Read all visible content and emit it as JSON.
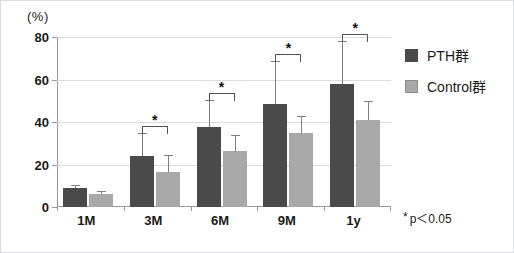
{
  "chart_data": {
    "type": "bar",
    "title": "",
    "subtitle": "",
    "xlabel": "",
    "ylabel": "(%)",
    "ylim": [
      0,
      80
    ],
    "ytick_labels": [
      "0",
      "20",
      "40",
      "60",
      "80"
    ],
    "yticks": [
      0,
      20,
      40,
      60,
      80
    ],
    "grid": true,
    "legend_position": "right",
    "categories": [
      "1M",
      "3M",
      "6M",
      "9M",
      "1y"
    ],
    "series": [
      {
        "name": "PTH群",
        "color": "#4a4a4a",
        "values": [
          9,
          24,
          37.5,
          48.5,
          58
        ],
        "errors": [
          1.5,
          11,
          13,
          20,
          20
        ]
      },
      {
        "name": "Control群",
        "color": "#a8a8a8",
        "values": [
          6,
          16.5,
          26.5,
          35,
          41
        ],
        "errors": [
          1.5,
          8,
          7.5,
          8,
          9
        ]
      }
    ],
    "annotations": [
      {
        "category": "3M",
        "label": "*",
        "type": "significance-bracket"
      },
      {
        "category": "6M",
        "label": "*",
        "type": "significance-bracket"
      },
      {
        "category": "9M",
        "label": "*",
        "type": "significance-bracket"
      },
      {
        "category": "1y",
        "label": "*",
        "type": "significance-bracket"
      }
    ],
    "footnote": "p＜0.05",
    "footnote_marker": "*"
  },
  "axis": {
    "unit_label": "(%)"
  },
  "legend": {
    "items": [
      {
        "label": "PTH群",
        "swatch": "dark-gray-swatch"
      },
      {
        "label": "Control群",
        "swatch": "light-gray-swatch"
      }
    ]
  },
  "footnote": {
    "marker": "*",
    "text": "p＜0.05"
  }
}
